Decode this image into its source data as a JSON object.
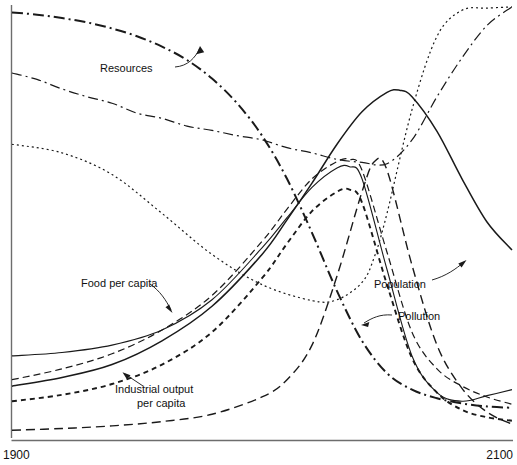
{
  "figure": {
    "name": "world3-standard-run",
    "axis": {
      "x_start_label": "1900",
      "x_end_label": "2100",
      "x_range": [
        1900,
        2100
      ],
      "y_axis_visible": true,
      "x_axis_visible": true,
      "ticks_visible": false,
      "grid": false,
      "axis_color": "#6d6d6d"
    },
    "labels": {
      "resources": "Resources",
      "food_per_capita": "Food per capita",
      "industrial_output_line1": "Industrial output",
      "industrial_output_line2": "per capita",
      "population": "Population",
      "pollution": "Pollution"
    }
  },
  "chart_data": {
    "type": "line",
    "title": "",
    "subtitle": "",
    "xlabel": "",
    "ylabel": "",
    "xlim": [
      1900,
      2100
    ],
    "ylim": [
      0,
      1
    ],
    "grid": false,
    "legend": "annotations-on-curves",
    "tick_labels": {
      "x": [
        "1900",
        "2100"
      ],
      "y": []
    },
    "annotations": [
      {
        "text": "Resources",
        "anchor_xy": [
          0.37,
          0.87
        ],
        "points_to_xy": [
          0.545,
          0.935
        ],
        "style": "curved-leader-arrow"
      },
      {
        "text": "Food per capita",
        "anchor_xy": [
          0.155,
          0.395
        ],
        "points_to_xy": [
          0.33,
          0.305
        ],
        "style": "curved-leader-arrow"
      },
      {
        "text": "Industrial output per capita",
        "anchor_xy": [
          0.225,
          0.17
        ],
        "points_to_xy": [
          0.235,
          0.215
        ],
        "style": "straight-leader-arrow"
      },
      {
        "text": "Population",
        "anchor_xy": [
          0.735,
          0.385
        ],
        "points_to_xy": [
          0.905,
          0.425
        ],
        "style": "curved-leader-arrow"
      },
      {
        "text": "Pollution",
        "anchor_xy": [
          0.79,
          0.315
        ],
        "points_to_xy": [
          0.685,
          0.295
        ],
        "style": "curved-leader-arrow"
      }
    ],
    "series": [
      {
        "name": "Resources",
        "line_style": "dash-dot",
        "stroke_width": 2.0,
        "dash_pattern": "11 4 2 4",
        "x": [
          1900,
          1910,
          1920,
          1930,
          1940,
          1950,
          1960,
          1970,
          1980,
          1990,
          2000,
          2010,
          2020,
          2030,
          2040,
          2050,
          2060,
          2070,
          2080,
          2090,
          2100
        ],
        "y": [
          0.985,
          0.98,
          0.972,
          0.962,
          0.948,
          0.93,
          0.906,
          0.875,
          0.832,
          0.775,
          0.7,
          0.6,
          0.475,
          0.34,
          0.225,
          0.15,
          0.112,
          0.092,
          0.08,
          0.073,
          0.07
        ]
      },
      {
        "name": "Pollution",
        "line_style": "long-dash",
        "stroke_width": 1.4,
        "dash_pattern": "9 5",
        "x": [
          1900,
          1920,
          1940,
          1960,
          1980,
          2000,
          2010,
          2020,
          2030,
          2040,
          2045,
          2050,
          2060,
          2070,
          2080,
          2090,
          2100
        ],
        "y": [
          0.018,
          0.022,
          0.028,
          0.038,
          0.055,
          0.095,
          0.135,
          0.215,
          0.375,
          0.57,
          0.64,
          0.62,
          0.4,
          0.215,
          0.115,
          0.06,
          0.032
        ]
      },
      {
        "name": "Food per capita",
        "line_style": "dashed",
        "stroke_width": 1.2,
        "dash_pattern": "7 4",
        "x": [
          1900,
          1920,
          1940,
          1960,
          1980,
          2000,
          2010,
          2020,
          2030,
          2035,
          2040,
          2050,
          2060,
          2070,
          2080,
          2090,
          2100
        ],
        "y": [
          0.135,
          0.16,
          0.195,
          0.25,
          0.33,
          0.455,
          0.53,
          0.6,
          0.64,
          0.645,
          0.62,
          0.43,
          0.245,
          0.16,
          0.12,
          0.095,
          0.078
        ]
      },
      {
        "name": "Industrial output per capita",
        "line_style": "short-dash",
        "stroke_width": 1.9,
        "dash_pattern": "5 4",
        "x": [
          1900,
          1920,
          1940,
          1960,
          1980,
          2000,
          2010,
          2020,
          2030,
          2035,
          2040,
          2050,
          2060,
          2070,
          2080,
          2090,
          2100
        ],
        "y": [
          0.085,
          0.1,
          0.125,
          0.17,
          0.245,
          0.37,
          0.45,
          0.525,
          0.57,
          0.575,
          0.545,
          0.355,
          0.185,
          0.105,
          0.065,
          0.048,
          0.04
        ]
      },
      {
        "name": "Population",
        "line_style": "solid",
        "stroke_width": 1.5,
        "dash_pattern": "",
        "x": [
          1900,
          1920,
          1940,
          1960,
          1980,
          2000,
          2010,
          2020,
          2030,
          2040,
          2050,
          2055,
          2060,
          2070,
          2080,
          2090,
          2100
        ],
        "y": [
          0.12,
          0.14,
          0.17,
          0.225,
          0.305,
          0.425,
          0.505,
          0.59,
          0.68,
          0.755,
          0.8,
          0.805,
          0.79,
          0.71,
          0.6,
          0.5,
          0.435
        ]
      },
      {
        "name": "Services per capita",
        "line_style": "solid-thin",
        "stroke_width": 1.1,
        "dash_pattern": "",
        "x": [
          1900,
          1920,
          1940,
          1960,
          1980,
          2000,
          2010,
          2020,
          2030,
          2035,
          2040,
          2050,
          2060,
          2070,
          2080,
          2090,
          2100
        ],
        "y": [
          0.19,
          0.198,
          0.215,
          0.25,
          0.32,
          0.44,
          0.51,
          0.58,
          0.625,
          0.628,
          0.6,
          0.39,
          0.19,
          0.105,
          0.085,
          0.098,
          0.112
        ]
      },
      {
        "name": "Life expectancy",
        "line_style": "fine-dotted",
        "stroke_width": 1.2,
        "dash_pattern": "2 3",
        "x": [
          1900,
          1920,
          1940,
          1960,
          1980,
          2000,
          2020,
          2030,
          2040,
          2045,
          2050,
          2060,
          2070,
          2080,
          2090,
          2100
        ],
        "y": [
          0.68,
          0.66,
          0.61,
          0.52,
          0.425,
          0.355,
          0.318,
          0.32,
          0.36,
          0.42,
          0.52,
          0.76,
          0.93,
          0.99,
          0.995,
          0.998
        ]
      },
      {
        "name": "Crude birth rate",
        "line_style": "dash-dot-thin",
        "stroke_width": 1.2,
        "dash_pattern": "10 4 2 4",
        "x": [
          1900,
          1910,
          1920,
          1930,
          1940,
          1950,
          1960,
          1970,
          1980,
          1990,
          2000,
          2010,
          2020,
          2030,
          2040,
          2050,
          2060,
          2070,
          2080,
          2090,
          2100
        ],
        "y": [
          0.845,
          0.83,
          0.808,
          0.79,
          0.775,
          0.752,
          0.74,
          0.722,
          0.712,
          0.7,
          0.69,
          0.672,
          0.66,
          0.645,
          0.638,
          0.635,
          0.69,
          0.79,
          0.88,
          0.955,
          0.998
        ]
      }
    ]
  }
}
